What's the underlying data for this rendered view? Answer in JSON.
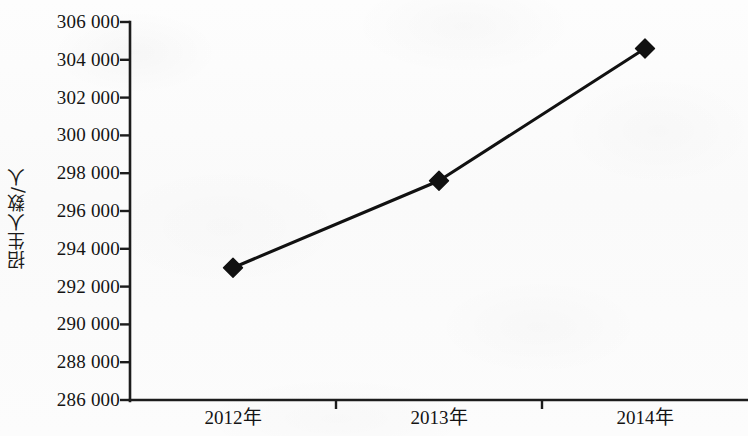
{
  "chart_data": {
    "type": "line",
    "title": "",
    "subtitle": "",
    "xlabel": "",
    "ylabel": "招生人数/人",
    "categories": [
      "2012年",
      "2013年",
      "2014年"
    ],
    "series": [
      {
        "name": "招生人数",
        "values": [
          293000,
          297600,
          304600
        ]
      }
    ],
    "ylim": [
      286000,
      306000
    ],
    "ytick_step": 2000,
    "ytick_labels": [
      "306 000",
      "304 000",
      "302 000",
      "300 000",
      "298 000",
      "296 000",
      "294 000",
      "292 000",
      "290 000",
      "288 000",
      "286 000"
    ],
    "ytick_values": [
      306000,
      304000,
      302000,
      300000,
      298000,
      296000,
      294000,
      292000,
      290000,
      288000,
      286000
    ],
    "grid": false,
    "legend": false,
    "legend_position": "none",
    "marker": "diamond",
    "line_color": "#111111",
    "marker_color": "#111111",
    "axis_color": "#1c1c1c",
    "background_color": "#fcfcfc"
  },
  "axes": {
    "y_title": "招生人数/人",
    "x_categories": [
      "2012年",
      "2013年",
      "2014年"
    ]
  }
}
